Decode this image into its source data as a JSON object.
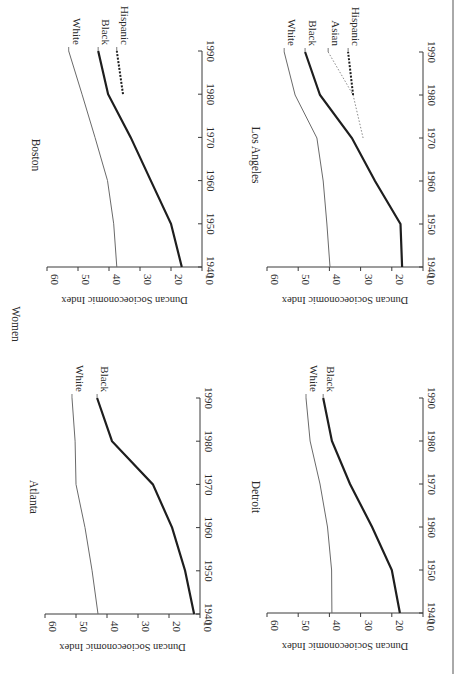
{
  "figure": {
    "group_label": "Women",
    "y_axis_title": "Duncan Socioeconomic Index",
    "x_ticks": [
      1940,
      1950,
      1960,
      1970,
      1980,
      1990
    ],
    "y_ticks": [
      10,
      20,
      30,
      40,
      50,
      60
    ],
    "orientation": "rotated 90° clockwise"
  },
  "chart_data": [
    {
      "type": "line",
      "title": "Boston",
      "xlabel": "",
      "ylabel": "Duncan Socioeconomic Index",
      "xlim": [
        1940,
        1990
      ],
      "ylim": [
        10,
        60
      ],
      "x": [
        1940,
        1950,
        1960,
        1970,
        1980,
        1990
      ],
      "series": [
        {
          "name": "White",
          "style": "thin",
          "x": [
            1940,
            1950,
            1960,
            1970,
            1980,
            1990
          ],
          "values": [
            37.5,
            38.5,
            40.5,
            44.5,
            48.7,
            53
          ]
        },
        {
          "name": "Black",
          "style": "thick",
          "x": [
            1940,
            1950,
            1960,
            1970,
            1980,
            1990
          ],
          "values": [
            16.5,
            20,
            26.5,
            33,
            40.3,
            43.5
          ]
        },
        {
          "name": "Hispanic",
          "style": "thick-dotted",
          "x": [
            1980,
            1990
          ],
          "values": [
            35.5,
            37.5
          ]
        }
      ]
    },
    {
      "type": "line",
      "title": "Los Angeles",
      "xlabel": "",
      "ylabel": "Duncan Socioeconomic Index",
      "xlim": [
        1940,
        1990
      ],
      "ylim": [
        10,
        60
      ],
      "x": [
        1940,
        1950,
        1960,
        1970,
        1980,
        1990
      ],
      "series": [
        {
          "name": "White",
          "style": "thin",
          "x": [
            1940,
            1950,
            1960,
            1970,
            1980,
            1990
          ],
          "values": [
            39.8,
            40.8,
            42,
            44,
            51,
            54.5
          ]
        },
        {
          "name": "Black",
          "style": "thick",
          "x": [
            1940,
            1950,
            1960,
            1970,
            1980,
            1990
          ],
          "values": [
            16.7,
            17.2,
            25.4,
            32.8,
            43,
            47.8
          ]
        },
        {
          "name": "Asian",
          "style": "thin-dotted",
          "x": [
            1970,
            1980,
            1990
          ],
          "values": [
            29.2,
            32.4,
            40.4
          ]
        },
        {
          "name": "Hispanic",
          "style": "thick-dotted",
          "x": [
            1980,
            1990
          ],
          "values": [
            32.4,
            34
          ]
        }
      ]
    },
    {
      "type": "line",
      "title": "Atlanta",
      "xlabel": "",
      "ylabel": "Duncan Socioeconomic Index",
      "xlim": [
        1940,
        1990
      ],
      "ylim": [
        10,
        60
      ],
      "x": [
        1940,
        1950,
        1960,
        1970,
        1980,
        1990
      ],
      "series": [
        {
          "name": "White",
          "style": "thin",
          "x": [
            1940,
            1950,
            1960,
            1970,
            1980,
            1990
          ],
          "values": [
            42.9,
            44.8,
            47.1,
            50,
            50.3,
            51.3
          ]
        },
        {
          "name": "Black",
          "style": "thick",
          "x": [
            1940,
            1950,
            1960,
            1970,
            1980,
            1990
          ],
          "values": [
            11.9,
            14.8,
            19,
            25.2,
            38.4,
            43.2
          ]
        }
      ]
    },
    {
      "type": "line",
      "title": "Detroit",
      "xlabel": "",
      "ylabel": "Duncan Socioeconomic Index",
      "xlim": [
        1940,
        1990
      ],
      "ylim": [
        10,
        60
      ],
      "x": [
        1940,
        1950,
        1960,
        1970,
        1980,
        1990
      ],
      "series": [
        {
          "name": "White",
          "style": "thin",
          "x": [
            1940,
            1950,
            1960,
            1970,
            1980,
            1990
          ],
          "values": [
            39.2,
            39.3,
            40.6,
            43,
            46.2,
            47.5
          ]
        },
        {
          "name": "Black",
          "style": "thick",
          "x": [
            1940,
            1950,
            1960,
            1970,
            1980,
            1990
          ],
          "values": [
            17.4,
            20,
            26.3,
            33.4,
            39.2,
            42
          ]
        }
      ]
    }
  ]
}
